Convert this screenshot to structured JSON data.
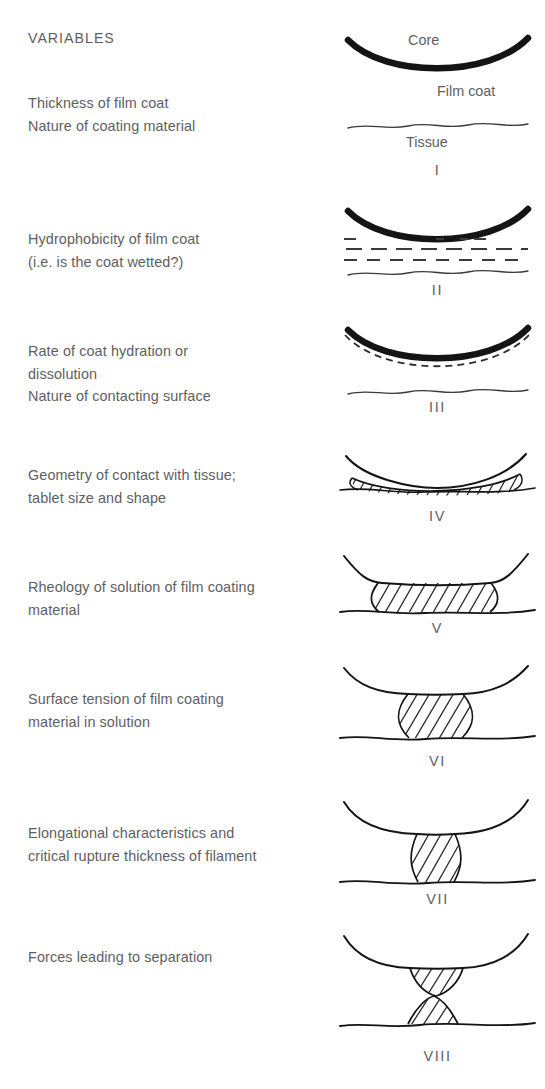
{
  "header": {
    "title": "VARIABLES"
  },
  "annotations": {
    "core": "Core",
    "film_coat": "Film coat",
    "tissue": "Tissue"
  },
  "colors": {
    "text": "#5e5e62",
    "ink": "#1a1a1a",
    "background": "#ffffff"
  },
  "stages": [
    {
      "numeral": "I",
      "variables": "Thickness of film coat\nNature of coating material",
      "figure": "core-above-tissue"
    },
    {
      "numeral": "II",
      "variables": "Hydrophobicity of film coat\n(i.e. is the coat wetted?)",
      "figure": "core-dashed-wetting-layers"
    },
    {
      "numeral": "III",
      "variables": "Rate of coat hydration or\ndissolution\nNature of contacting surface",
      "figure": "core-dashed-hydrated-layer"
    },
    {
      "numeral": "IV",
      "variables": "Geometry of contact with tissue;\ntablet size and shape",
      "figure": "thin-wide-hatched-contact"
    },
    {
      "numeral": "V",
      "variables": "Rheology of solution of film coating\nmaterial",
      "figure": "wide-hatched-bridge"
    },
    {
      "numeral": "VI",
      "variables": "Surface tension of film coating\nmaterial in solution",
      "figure": "waisted-hatched-bridge"
    },
    {
      "numeral": "VII",
      "variables": "Elongational characteristics and\ncritical rupture thickness of filament",
      "figure": "thin-elongated-filament"
    },
    {
      "numeral": "VIII",
      "variables": "Forces leading to separation",
      "figure": "ruptured-separated-droplets"
    }
  ]
}
